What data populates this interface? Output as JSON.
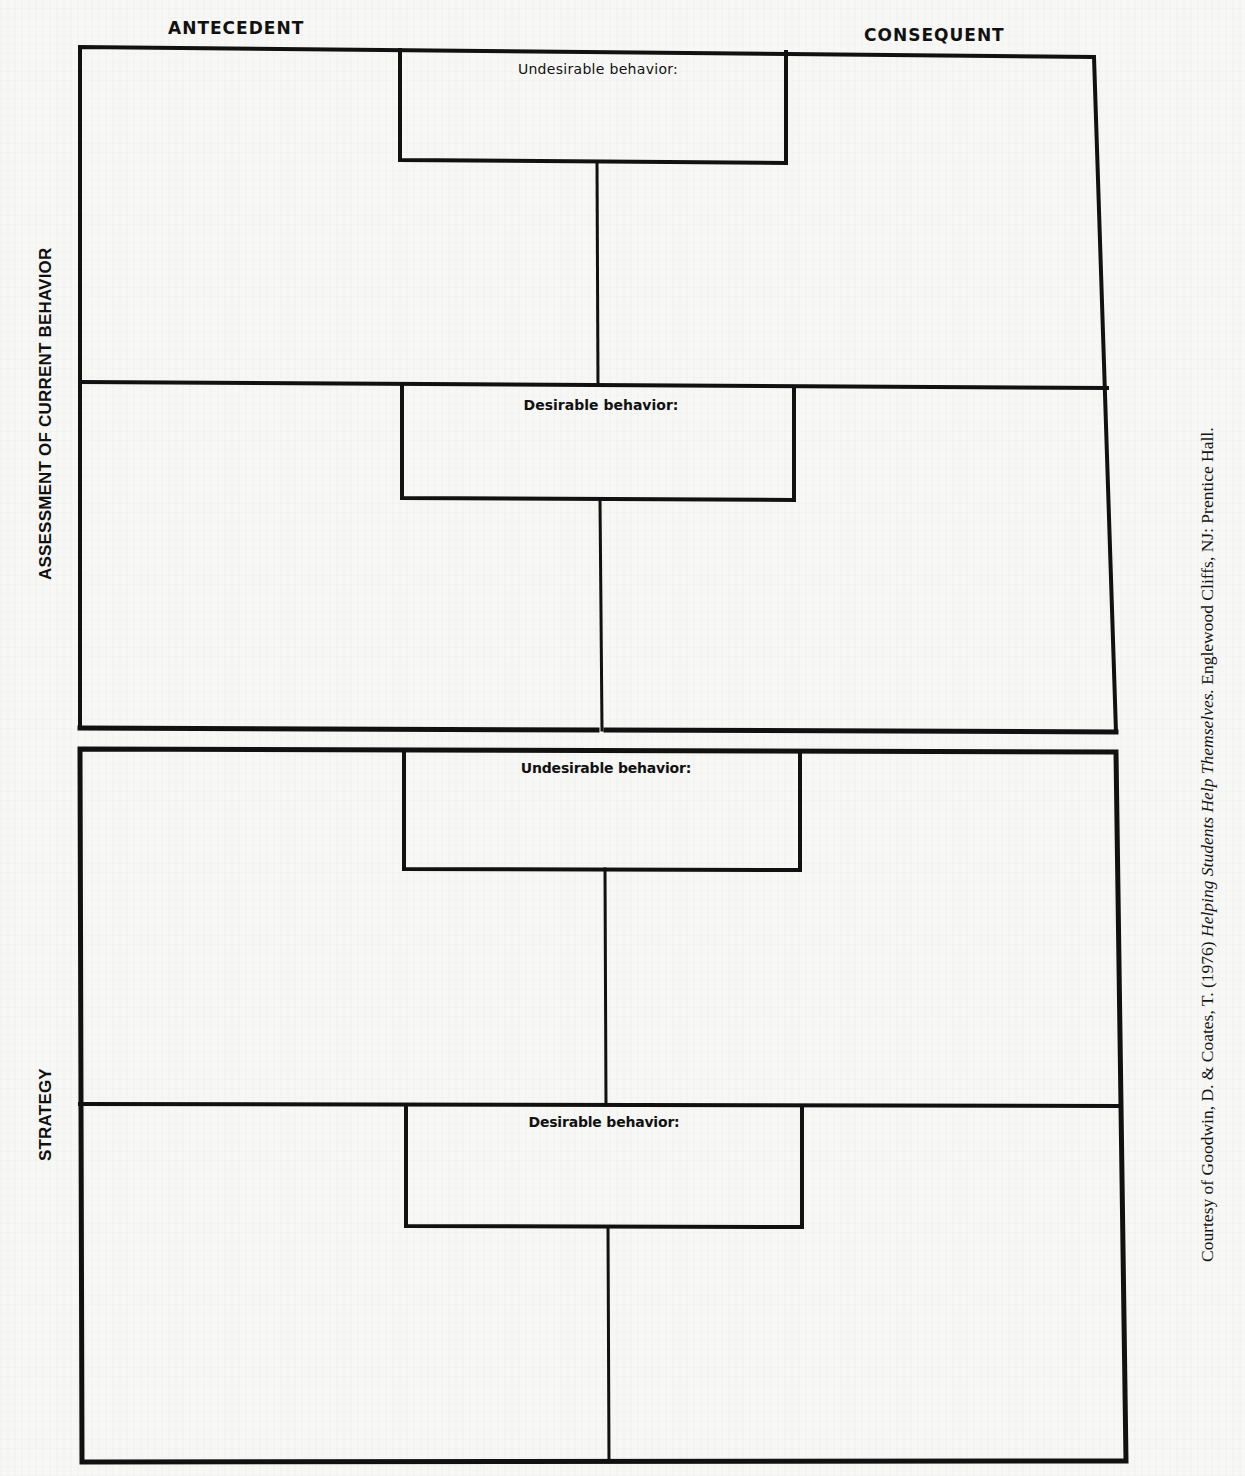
{
  "headers": {
    "antecedent": "ANTECEDENT",
    "consequent": "CONSEQUENT"
  },
  "side_labels": {
    "assessment": "ASSESSMENT OF CURRENT BEHAVIOR",
    "strategy": "STRATEGY"
  },
  "sections": [
    {
      "name": "assessment",
      "boxes": [
        {
          "label": "Undesirable behavior:"
        },
        {
          "label": "Desirable behavior:"
        }
      ]
    },
    {
      "name": "strategy",
      "boxes": [
        {
          "label": "Undesirable behavior:"
        },
        {
          "label": "Desirable behavior:"
        }
      ]
    }
  ],
  "citation": {
    "prefix": "Courtesy of Goodwin, D. & Coates, T. (1976) ",
    "title": "Helping Students Help Themselves.",
    "suffix": "  Englewood Cliffs, NJ:  Prentice Hall."
  },
  "colors": {
    "ink": "#111111",
    "paper": "#f7f7f5"
  }
}
